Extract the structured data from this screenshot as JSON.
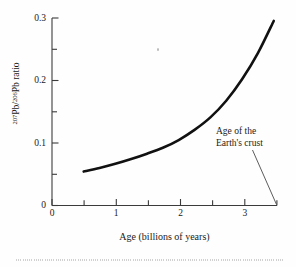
{
  "chart_data": {
    "type": "line",
    "title": "",
    "xlabel": "Age (billions of years)",
    "ylabel": "207Pb/206Pb ratio",
    "ylabel_parts": {
      "num_sup": "207",
      "num_base": "Pb",
      "slash": "/",
      "den_sup": "206",
      "den_base": "Pb",
      "suffix": " ratio"
    },
    "xlim": [
      0,
      3.55
    ],
    "ylim": [
      0,
      0.315
    ],
    "grid": false,
    "legend": null,
    "x_major_ticks": [
      0,
      1,
      2,
      3
    ],
    "x_major_tick_labels": [
      "0",
      "1",
      "2",
      "3"
    ],
    "x_minor_ticks": [
      0.5,
      1.5,
      2.5,
      3.5
    ],
    "y_major_ticks": [
      0,
      0.1,
      0.2,
      0.3
    ],
    "y_major_tick_labels": [
      "0",
      "0.1",
      "0.2",
      "0.3"
    ],
    "y_minor_ticks": [
      0.05,
      0.15,
      0.25
    ],
    "x": [
      0.5,
      0.75,
      1.0,
      1.25,
      1.5,
      1.75,
      2.0,
      2.25,
      2.5,
      2.75,
      3.0,
      3.25,
      3.5
    ],
    "y": [
      0.057,
      0.063,
      0.07,
      0.078,
      0.087,
      0.097,
      0.11,
      0.127,
      0.148,
      0.176,
      0.212,
      0.256,
      0.31
    ],
    "series_name": "Pb isotope ratio growth curve",
    "line_color": "#111111",
    "line_width": 2.6,
    "annotations": [
      {
        "name": "age-of-earths-crust",
        "line1": "Age of the",
        "line2": "Earth's crust",
        "points_to_x": 3.5,
        "points_to_y": 0
      }
    ]
  },
  "figure": {
    "background_color": "#fefefe",
    "axis_color": "#3b3b3b"
  }
}
